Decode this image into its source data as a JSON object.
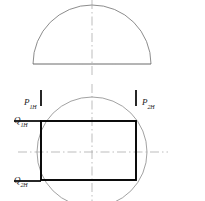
{
  "drawing": {
    "title": "Orthographic projection: semicircular top view with circular bottom view and inscribed rectangle",
    "canvas": {
      "width": 205,
      "height": 201,
      "background": "#ffffff"
    },
    "colors": {
      "outline_thin": "#6e6e6e",
      "outline_bold": "#000000",
      "centerline": "#9a9a9a",
      "label_text": "#1a1a1a",
      "tick_mark": "#000000"
    },
    "top_view": {
      "name": "semicircle-dome",
      "center_x": 92,
      "base_y": 64,
      "radius": 59,
      "apex_y": 5,
      "left_x": 33,
      "right_x": 152
    },
    "bottom_view": {
      "name": "circle-with-inscribed-rectangle",
      "circle": {
        "cx": 92,
        "cy": 152,
        "r": 55
      },
      "rectangle": {
        "x": 41,
        "y": 121,
        "width": 95,
        "height": 59
      }
    },
    "centerlines": {
      "top_vertical": {
        "x": 92,
        "y1": 0,
        "y2": 78
      },
      "bottom_vertical": {
        "x": 92,
        "y1": 84,
        "y2": 201
      },
      "bottom_horizontal": {
        "y": 152,
        "x1": 18,
        "x2": 168
      }
    }
  },
  "labels": {
    "p1h": {
      "base": "P",
      "sub": "1H",
      "full": "P1H"
    },
    "p2h": {
      "base": "P",
      "sub": "2H",
      "full": "P2H"
    },
    "q1h": {
      "base": "Q",
      "sub": "1H",
      "full": "Q1H"
    },
    "q2h": {
      "base": "Q",
      "sub": "2H",
      "full": "Q2H"
    }
  },
  "marks": {
    "p1h_tick": {
      "x": 41,
      "y1": 90,
      "y2": 106
    },
    "p2h_tick": {
      "x": 136,
      "y1": 90,
      "y2": 106
    },
    "q1h_rule": {
      "y": 121,
      "x1": 14,
      "x2": 41
    },
    "q2h_rule": {
      "y": 181,
      "x1": 14,
      "x2": 41
    }
  }
}
